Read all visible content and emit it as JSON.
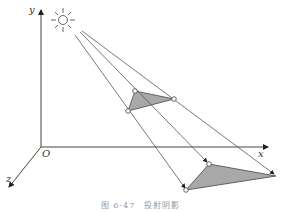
{
  "axes": {
    "x_label": "x",
    "y_label": "y",
    "z_label": "z",
    "origin_label": "O"
  },
  "caption": "图 6-47　投射阴影",
  "colors": {
    "line": "#555555",
    "fill": "#a8a8a8"
  },
  "icons": {
    "light_source": "sun-icon"
  }
}
